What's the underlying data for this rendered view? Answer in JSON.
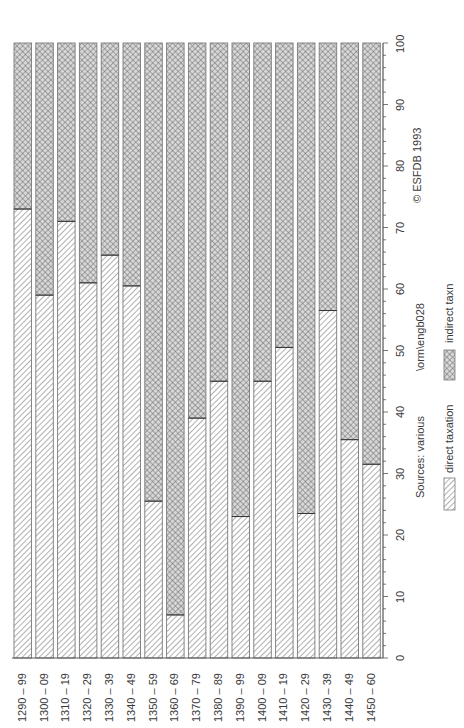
{
  "chart_data": {
    "type": "bar",
    "stacked": true,
    "percent_stacked": true,
    "orientation": "vertical bars, text rotated 90° (page printed sideways)",
    "title": "",
    "xlabel": "",
    "ylabel": "",
    "ylim": [
      0,
      100
    ],
    "yticks": [
      0,
      10,
      20,
      30,
      40,
      50,
      60,
      70,
      80,
      90,
      100
    ],
    "minor_ticks_per_major": 5,
    "grid": false,
    "categories": [
      "1290 – 99",
      "1300 – 09",
      "1310 – 19",
      "1320 – 29",
      "1330 – 39",
      "1340 – 49",
      "1350 – 59",
      "1360 – 69",
      "1370 – 79",
      "1380 – 89",
      "1390 – 99",
      "1400 – 09",
      "1410 – 19",
      "1420 – 29",
      "1430 – 39",
      "1440 – 49",
      "1450 – 60"
    ],
    "series": [
      {
        "name": "direct taxation",
        "pattern": "diagonal-hatch",
        "values": [
          73,
          59,
          71,
          61,
          65.5,
          60.5,
          25.5,
          7,
          39,
          45,
          23,
          45,
          50.5,
          23.5,
          56.5,
          35.5,
          31.5
        ]
      },
      {
        "name": "indirect taxn",
        "pattern": "cross-hatch",
        "values": [
          27,
          41,
          29,
          39,
          34.5,
          39.5,
          74.5,
          93,
          61,
          55,
          77,
          55,
          49.5,
          76.5,
          43.5,
          64.5,
          68.5
        ]
      }
    ],
    "legend": {
      "position": "right",
      "entries": [
        "direct taxation",
        "indirect taxn"
      ]
    },
    "annotations": [
      "Sources: various",
      "\\orm\\engb028",
      "© ESFDB 1993"
    ]
  },
  "colors": {
    "border": "#7a7a7a",
    "hatch": "#6e6e6e",
    "text": "#3a3a3a",
    "axis": "#555555"
  }
}
